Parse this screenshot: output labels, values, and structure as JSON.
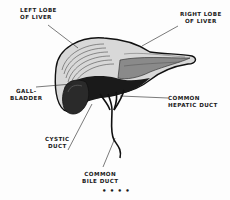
{
  "figure": {
    "type": "anatomical-illustration",
    "labels": {
      "left_lobe": [
        "Left lobe",
        "of liver"
      ],
      "right_lobe": [
        "Right lobe",
        "of liver"
      ],
      "gallbladder": [
        "Gall-",
        "bladder"
      ],
      "cystic_duct": [
        "Cystic",
        "duct"
      ],
      "common_hepatic_duct": [
        "Common",
        "hepatic duct"
      ],
      "common_bile_duct": [
        "Common",
        "bile duct"
      ]
    },
    "footer_mark": "• • • •"
  }
}
